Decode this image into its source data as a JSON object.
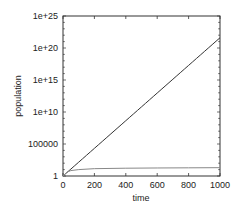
{
  "chart_data": {
    "type": "line",
    "title": "",
    "xlabel": "time",
    "ylabel": "population",
    "xscale": "linear",
    "yscale": "log",
    "xlim": [
      0,
      1000
    ],
    "ylim": [
      1,
      1e+25
    ],
    "grid": false,
    "legend": null,
    "x_ticks": [
      0,
      200,
      400,
      600,
      800,
      1000
    ],
    "x_tick_labels": [
      "0",
      "200",
      "400",
      "600",
      "800",
      "1000"
    ],
    "y_ticks": [
      1,
      100000,
      10000000000.0,
      1000000000000000.0,
      1e+20,
      1e+25
    ],
    "y_tick_labels": [
      "1",
      "100000",
      "1e+10",
      "1e+15",
      "1e+20",
      "1e+25"
    ],
    "series": [
      {
        "name": "exponential growth",
        "color": "#333333",
        "x": [
          0,
          200,
          400,
          600,
          800,
          1000
        ],
        "values": [
          1,
          22000.0,
          480000000.0,
          10000000000000.0,
          2.2e+17,
          4e+21
        ]
      },
      {
        "name": "logistic growth",
        "color": "#888888",
        "x": [
          0,
          25,
          50,
          100,
          200,
          400,
          600,
          800,
          1000
        ],
        "values": [
          1,
          4,
          7,
          10,
          14,
          16.5,
          18,
          19,
          20
        ]
      }
    ]
  },
  "layout": {
    "plot_left": 63,
    "plot_right": 220,
    "plot_top": 16,
    "plot_bottom": 176
  }
}
